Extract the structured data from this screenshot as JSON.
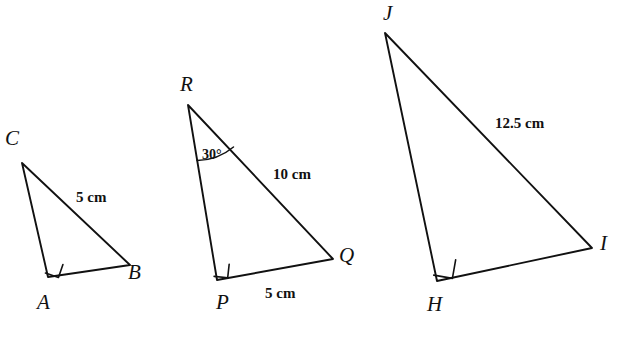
{
  "figure": {
    "background_color": "#ffffff",
    "stroke_color": "#111111",
    "width": 626,
    "height": 340
  },
  "triangles": [
    {
      "name": "triangle-abc",
      "vertices": [
        {
          "label": "C",
          "name": "vertex-label-c",
          "x": 22,
          "y": 163,
          "label_x": 5,
          "label_y": 128
        },
        {
          "label": "A",
          "name": "vertex-label-a",
          "x": 48,
          "y": 277,
          "label_x": 37,
          "label_y": 292
        },
        {
          "label": "B",
          "name": "vertex-label-b",
          "x": 130,
          "y": 265,
          "label_x": 128,
          "label_y": 262
        }
      ],
      "right_angle_vertex": "A",
      "side_labels": [
        {
          "text": "5 cm",
          "name": "side-label-cb",
          "x": 76,
          "y": 190
        }
      ],
      "angle_labels": []
    },
    {
      "name": "triangle-pqr",
      "vertices": [
        {
          "label": "R",
          "name": "vertex-label-r",
          "x": 188,
          "y": 105,
          "label_x": 180,
          "label_y": 74
        },
        {
          "label": "P",
          "name": "vertex-label-p",
          "x": 217,
          "y": 280,
          "label_x": 216,
          "label_y": 292
        },
        {
          "label": "Q",
          "name": "vertex-label-q",
          "x": 333,
          "y": 259,
          "label_x": 339,
          "label_y": 245
        }
      ],
      "right_angle_vertex": "P",
      "side_labels": [
        {
          "text": "10 cm",
          "name": "side-label-rq",
          "x": 273,
          "y": 167
        },
        {
          "text": "5 cm",
          "name": "side-label-pq",
          "x": 265,
          "y": 286
        }
      ],
      "angle_labels": [
        {
          "text": "30°",
          "name": "angle-label-r",
          "x": 202,
          "y": 148
        }
      ]
    },
    {
      "name": "triangle-hij",
      "vertices": [
        {
          "label": "J",
          "name": "vertex-label-j",
          "x": 385,
          "y": 33,
          "label_x": 383,
          "label_y": 3
        },
        {
          "label": "H",
          "name": "vertex-label-h",
          "x": 437,
          "y": 281,
          "label_x": 427,
          "label_y": 294
        },
        {
          "label": "I",
          "name": "vertex-label-i",
          "x": 592,
          "y": 248,
          "label_x": 600,
          "label_y": 233
        }
      ],
      "right_angle_vertex": "H",
      "side_labels": [
        {
          "text": "12.5 cm",
          "name": "side-label-ji",
          "x": 495,
          "y": 116
        }
      ],
      "angle_labels": []
    }
  ]
}
